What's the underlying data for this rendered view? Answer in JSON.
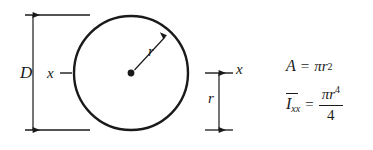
{
  "figure": {
    "type": "engineering-cross-section-property-diagram",
    "shape": "circle",
    "geometry": {
      "circle_center_x": 131,
      "circle_center_y": 73,
      "circle_radius": 57,
      "top_extension_line_y": 15,
      "bottom_extension_line_y": 130,
      "centroidal_axis_y": 73
    },
    "labels": {
      "diameter": "D",
      "axis_left": "x",
      "axis_right": "x",
      "radius_arrow": "r",
      "radius_dimension": "r"
    },
    "formulas": {
      "area": {
        "lhs": "A",
        "equals": "=",
        "pi": "π",
        "var": "r",
        "exponent": "2"
      },
      "moment_of_inertia": {
        "lhs": "I",
        "subscript": "xx",
        "equals": "=",
        "numerator_pi": "π",
        "numerator_var": "r",
        "numerator_exponent": "4",
        "denominator": "4"
      }
    },
    "colors": {
      "stroke": "#1a1a1a",
      "background": "#ffffff"
    }
  }
}
